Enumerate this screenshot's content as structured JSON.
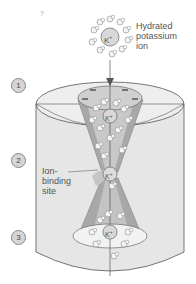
{
  "diagram": {
    "type": "potassium-channel-illustration",
    "corner_mark": "?",
    "labels": {
      "hydrated_ion": [
        "Hydrated",
        "potassium",
        "ion"
      ],
      "binding_site": [
        "Ion-",
        "binding",
        "site"
      ]
    },
    "steps": [
      "1",
      "2",
      "3"
    ],
    "ion_symbol": "K",
    "ion_charge": "+",
    "colors": {
      "background": "#ffffff",
      "cylinder_side": "#e6e6e6",
      "cylinder_top": "#eeeeee",
      "cone_outer": "#a8a8a8",
      "cone_inner": "#cfcfcf",
      "outline": "#555555",
      "water_molecule": "#f4f4f4",
      "label_text": "#555555"
    }
  }
}
